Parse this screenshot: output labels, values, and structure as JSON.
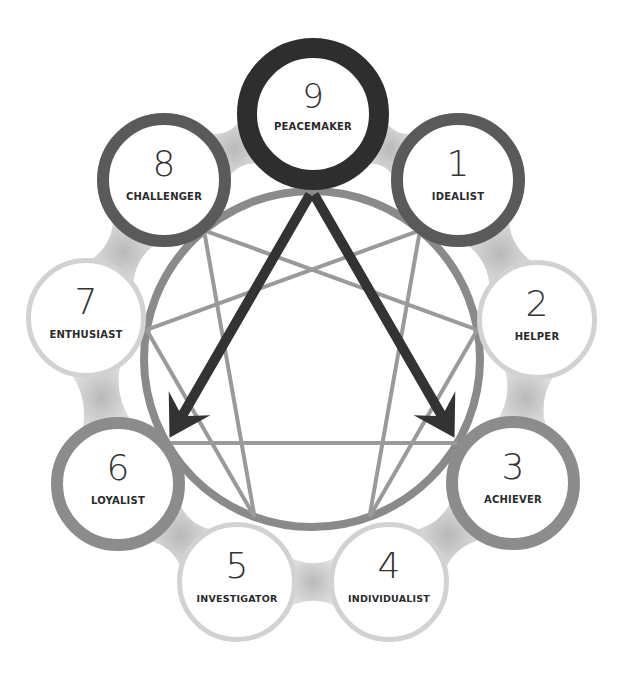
{
  "diagram": {
    "circle": {
      "cx": 312,
      "cy": 359,
      "r": 168,
      "stroke": "#8a8a8a"
    },
    "highlight_type": "9",
    "arrows": [
      {
        "from": "9",
        "to": "6",
        "color": "#333333"
      },
      {
        "from": "9",
        "to": "3",
        "color": "#333333"
      }
    ],
    "nodes": [
      {
        "id": "9",
        "number": "9",
        "label": "PEACEMAKER",
        "cx": 313,
        "cy": 114,
        "r": 76,
        "ring": "#2e2e2e",
        "ring_width": 20
      },
      {
        "id": "1",
        "number": "1",
        "label": "IDEALIST",
        "cx": 458,
        "cy": 180,
        "r": 67,
        "ring": "#5a5a5a",
        "ring_width": 12
      },
      {
        "id": "2",
        "number": "2",
        "label": "HELPER",
        "cx": 537,
        "cy": 320,
        "r": 60,
        "ring": "#d2d2d2",
        "ring_width": 5
      },
      {
        "id": "3",
        "number": "3",
        "label": "ACHIEVER",
        "cx": 513,
        "cy": 483,
        "r": 67,
        "ring": "#8c8c8c",
        "ring_width": 12
      },
      {
        "id": "4",
        "number": "4",
        "label": "INDIVIDUALIST",
        "cx": 389,
        "cy": 582,
        "r": 60,
        "ring": "#d2d2d2",
        "ring_width": 5
      },
      {
        "id": "5",
        "number": "5",
        "label": "INVESTIGATOR",
        "cx": 237,
        "cy": 582,
        "r": 60,
        "ring": "#d2d2d2",
        "ring_width": 5
      },
      {
        "id": "6",
        "number": "6",
        "label": "LOYALIST",
        "cx": 118,
        "cy": 484,
        "r": 67,
        "ring": "#8c8c8c",
        "ring_width": 12
      },
      {
        "id": "7",
        "number": "7",
        "label": "ENTHUSIAST",
        "cx": 86,
        "cy": 318,
        "r": 60,
        "ring": "#d2d2d2",
        "ring_width": 5
      },
      {
        "id": "8",
        "number": "8",
        "label": "CHALLENGER",
        "cx": 164,
        "cy": 180,
        "r": 67,
        "ring": "#5a5a5a",
        "ring_width": 12
      }
    ],
    "lines": [
      [
        "1",
        "4"
      ],
      [
        "4",
        "2"
      ],
      [
        "2",
        "8"
      ],
      [
        "8",
        "5"
      ],
      [
        "5",
        "7"
      ],
      [
        "7",
        "1"
      ],
      [
        "3",
        "6"
      ]
    ]
  }
}
